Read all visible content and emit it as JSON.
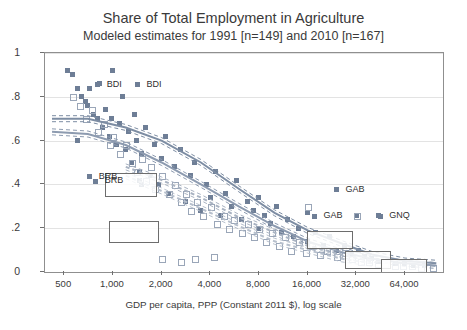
{
  "title": {
    "main": "Share of Total Employment in Agriculture",
    "sub": "Modeled estimates for 1991 [n=149] and 2010 [n=167]"
  },
  "axes": {
    "xlabel": "GDP per capita, PPP (Constant 2011 $), log scale",
    "ylabel": "",
    "yticks": [
      "0",
      ".2",
      ".4",
      ".6",
      ".8",
      "1"
    ],
    "xticks": [
      "500",
      "1,000",
      "2,000",
      "4,000",
      "8,000",
      "16,000",
      "32,000",
      "64,000"
    ]
  },
  "annotations": [
    {
      "text": "BDI",
      "x": 0.155,
      "y": 0.145
    },
    {
      "text": "BDI",
      "x": 0.255,
      "y": 0.145
    },
    {
      "text": "BRB",
      "x": 0.135,
      "y": 0.565
    },
    {
      "text": "BRB",
      "x": 0.15,
      "y": 0.585
    },
    {
      "text": "GAB",
      "x": 0.755,
      "y": 0.625
    },
    {
      "text": "GAB",
      "x": 0.7,
      "y": 0.745
    },
    {
      "text": "GNQ",
      "x": 0.865,
      "y": 0.745
    }
  ],
  "chart_data": {
    "type": "scatter",
    "title": "Share of Total Employment in Agriculture",
    "subtitle": "Modeled estimates for 1991 [n=149] and 2010 [n=167]",
    "xlabel": "GDP per capita, PPP (Constant 2011 $), log scale",
    "ylabel": "Share of total employment in agriculture",
    "xscale": "log",
    "xlim": [
      380,
      110000
    ],
    "ylim": [
      0,
      1
    ],
    "xticks": [
      500,
      1000,
      2000,
      4000,
      8000,
      16000,
      32000,
      64000
    ],
    "yticks": [
      0,
      0.2,
      0.4,
      0.6,
      0.8,
      1
    ],
    "grid": true,
    "legend": "none",
    "series": [
      {
        "name": "1991 [n=149]",
        "marker": "filled-square",
        "color": "#6e7e96",
        "points": [
          [
            520,
            0.92
          ],
          [
            560,
            0.9
          ],
          [
            600,
            0.84
          ],
          [
            640,
            0.8
          ],
          [
            680,
            0.78
          ],
          [
            700,
            0.76
          ],
          [
            720,
            0.84
          ],
          [
            760,
            0.72
          ],
          [
            800,
            0.7
          ],
          [
            820,
            0.86
          ],
          [
            860,
            0.66
          ],
          [
            900,
            0.74
          ],
          [
            950,
            0.62
          ],
          [
            980,
            0.7
          ],
          [
            1000,
            0.92
          ],
          [
            1050,
            0.58
          ],
          [
            1100,
            0.68
          ],
          [
            1150,
            0.8
          ],
          [
            1200,
            0.56
          ],
          [
            1250,
            0.64
          ],
          [
            1300,
            0.5
          ],
          [
            1350,
            0.72
          ],
          [
            1400,
            0.6
          ],
          [
            1450,
            0.46
          ],
          [
            1500,
            0.54
          ],
          [
            1600,
            0.66
          ],
          [
            1700,
            0.44
          ],
          [
            1800,
            0.58
          ],
          [
            1900,
            0.4
          ],
          [
            2000,
            0.52
          ],
          [
            2100,
            0.62
          ],
          [
            2200,
            0.36
          ],
          [
            2400,
            0.48
          ],
          [
            2600,
            0.56
          ],
          [
            2800,
            0.32
          ],
          [
            3000,
            0.44
          ],
          [
            3200,
            0.5
          ],
          [
            3500,
            0.28
          ],
          [
            3800,
            0.4
          ],
          [
            4000,
            0.34
          ],
          [
            4300,
            0.46
          ],
          [
            4600,
            0.26
          ],
          [
            5000,
            0.36
          ],
          [
            5400,
            0.3
          ],
          [
            5800,
            0.42
          ],
          [
            6200,
            0.24
          ],
          [
            6800,
            0.32
          ],
          [
            7400,
            0.28
          ],
          [
            8000,
            0.2
          ],
          [
            8600,
            0.26
          ],
          [
            9400,
            0.22
          ],
          [
            10200,
            0.3
          ],
          [
            11000,
            0.18
          ],
          [
            12000,
            0.24
          ],
          [
            13000,
            0.16
          ],
          [
            14000,
            0.2
          ],
          [
            16000,
            0.14
          ],
          [
            18000,
            0.18
          ],
          [
            20000,
            0.12
          ],
          [
            22000,
            0.16
          ],
          [
            24000,
            0.1
          ],
          [
            27000,
            0.12
          ],
          [
            30000,
            0.08
          ],
          [
            33000,
            0.1
          ],
          [
            36000,
            0.07
          ],
          [
            40000,
            0.06
          ],
          [
            44000,
            0.05
          ],
          [
            50000,
            0.05
          ],
          [
            56000,
            0.04
          ],
          [
            64000,
            0.04
          ],
          [
            72000,
            0.03
          ],
          [
            85000,
            0.03
          ],
          [
            600,
            0.6
          ],
          [
            1450,
            0.42
          ],
          [
            1500,
            0.4
          ],
          [
            8000,
            0.34
          ],
          [
            16000,
            0.27
          ],
          [
            32000,
            0.26
          ],
          [
            44000,
            0.26
          ]
        ]
      },
      {
        "name": "2010 [n=167]",
        "marker": "open-square",
        "color": "#9aa6b8",
        "points": [
          [
            560,
            0.8
          ],
          [
            620,
            0.76
          ],
          [
            680,
            0.7
          ],
          [
            740,
            0.74
          ],
          [
            800,
            0.64
          ],
          [
            880,
            0.68
          ],
          [
            950,
            0.58
          ],
          [
            1000,
            0.62
          ],
          [
            1100,
            0.54
          ],
          [
            1200,
            0.58
          ],
          [
            1300,
            0.5
          ],
          [
            1400,
            0.46
          ],
          [
            1500,
            0.52
          ],
          [
            1600,
            0.42
          ],
          [
            1700,
            0.48
          ],
          [
            1800,
            0.38
          ],
          [
            2000,
            0.44
          ],
          [
            2200,
            0.36
          ],
          [
            2400,
            0.4
          ],
          [
            2600,
            0.32
          ],
          [
            2800,
            0.36
          ],
          [
            3000,
            0.28
          ],
          [
            3300,
            0.32
          ],
          [
            3600,
            0.26
          ],
          [
            4000,
            0.3
          ],
          [
            4400,
            0.22
          ],
          [
            4800,
            0.26
          ],
          [
            5200,
            0.2
          ],
          [
            5600,
            0.24
          ],
          [
            6200,
            0.18
          ],
          [
            6800,
            0.22
          ],
          [
            7400,
            0.16
          ],
          [
            8000,
            0.2
          ],
          [
            8800,
            0.14
          ],
          [
            9600,
            0.18
          ],
          [
            10500,
            0.12
          ],
          [
            11500,
            0.16
          ],
          [
            12500,
            0.1
          ],
          [
            14000,
            0.14
          ],
          [
            15500,
            0.09
          ],
          [
            17000,
            0.12
          ],
          [
            19000,
            0.08
          ],
          [
            21000,
            0.1
          ],
          [
            24000,
            0.07
          ],
          [
            27000,
            0.09
          ],
          [
            30000,
            0.06
          ],
          [
            34000,
            0.05
          ],
          [
            38000,
            0.05
          ],
          [
            43000,
            0.04
          ],
          [
            48000,
            0.04
          ],
          [
            55000,
            0.03
          ],
          [
            62000,
            0.03
          ],
          [
            70000,
            0.03
          ],
          [
            80000,
            0.02
          ],
          [
            95000,
            0.02
          ],
          [
            2000,
            0.06
          ],
          [
            2600,
            0.05
          ],
          [
            3200,
            0.06
          ],
          [
            4200,
            0.07
          ],
          [
            32000,
            0.26
          ],
          [
            16000,
            0.3
          ]
        ]
      }
    ],
    "fit_lines": [
      {
        "name": "1991 fit",
        "style": "solid",
        "color": "#7d8da3",
        "points": [
          [
            420,
            0.7
          ],
          [
            700,
            0.7
          ],
          [
            1200,
            0.66
          ],
          [
            2000,
            0.6
          ],
          [
            3500,
            0.5
          ],
          [
            6000,
            0.38
          ],
          [
            10000,
            0.27
          ],
          [
            16000,
            0.19
          ],
          [
            26000,
            0.13
          ],
          [
            40000,
            0.08
          ],
          [
            64000,
            0.05
          ],
          [
            100000,
            0.04
          ]
        ]
      },
      {
        "name": "2010 fit",
        "style": "solid",
        "color": "#8d9bb0",
        "points": [
          [
            420,
            0.64
          ],
          [
            700,
            0.63
          ],
          [
            1200,
            0.58
          ],
          [
            2000,
            0.5
          ],
          [
            3500,
            0.4
          ],
          [
            6000,
            0.3
          ],
          [
            10000,
            0.21
          ],
          [
            16000,
            0.14
          ],
          [
            26000,
            0.09
          ],
          [
            40000,
            0.06
          ],
          [
            64000,
            0.04
          ],
          [
            100000,
            0.03
          ]
        ]
      },
      {
        "name": "1991 CI band",
        "style": "dashed",
        "color": "#a9b3c2",
        "points": [
          [
            1200,
            0.48
          ],
          [
            2000,
            0.42
          ],
          [
            3500,
            0.34
          ],
          [
            6000,
            0.25
          ],
          [
            10000,
            0.18
          ],
          [
            16000,
            0.12
          ],
          [
            26000,
            0.08
          ],
          [
            40000,
            0.05
          ]
        ]
      },
      {
        "name": "2010 CI band",
        "style": "dashed",
        "color": "#b6bfcc",
        "points": [
          [
            1200,
            0.44
          ],
          [
            2000,
            0.37
          ],
          [
            3500,
            0.29
          ],
          [
            6000,
            0.21
          ],
          [
            10000,
            0.14
          ],
          [
            16000,
            0.1
          ],
          [
            26000,
            0.06
          ],
          [
            40000,
            0.04
          ]
        ]
      }
    ]
  }
}
